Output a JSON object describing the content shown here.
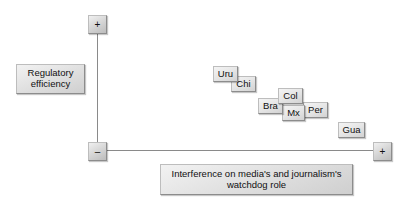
{
  "figure": {
    "type": "scatter",
    "background_color": "#ffffff",
    "box_fill_color": "#e3e3e3",
    "box_border_color": "#8c8c8c",
    "axis_color": "#8a8a8a"
  },
  "axes": {
    "y": {
      "label": "Regulatory efficiency",
      "positive_marker": "+",
      "negative_marker": "–"
    },
    "x": {
      "label": "Interference on media's and journalism's watchdog role",
      "positive_marker": "+",
      "negative_marker": "–"
    }
  },
  "chart_data": {
    "type": "scatter",
    "title": "",
    "xlabel": "Interference on media's and journalism's watchdog role",
    "ylabel": "Regulatory efficiency",
    "xlim": [
      0,
      1
    ],
    "ylim": [
      0,
      1
    ],
    "grid": false,
    "legend": "none",
    "axis_markers": {
      "y_top": "+",
      "y_bottom": "–",
      "x_left": "–",
      "x_right": "+"
    },
    "annotations": [
      "Axes are qualitative: vertical axis runs from – (bottom) to + (top); horizontal axis runs from – (left) to + (right).",
      "Countries are plotted as labelled boxes forming a downward-sloping band from upper-left to lower-right."
    ],
    "points": [
      {
        "label": "Uru",
        "name": "Uruguay",
        "x": 0.44,
        "y": 0.68
      },
      {
        "label": "Chi",
        "name": "Chile",
        "x": 0.51,
        "y": 0.61
      },
      {
        "label": "Bra",
        "name": "Brazil",
        "x": 0.6,
        "y": 0.5
      },
      {
        "label": "Col",
        "name": "Colombia",
        "x": 0.67,
        "y": 0.55
      },
      {
        "label": "Mx",
        "name": "Mexico",
        "x": 0.69,
        "y": 0.44
      },
      {
        "label": "Per",
        "name": "Peru",
        "x": 0.76,
        "y": 0.46
      },
      {
        "label": "Gua",
        "name": "Guatemala",
        "x": 0.89,
        "y": 0.31
      }
    ]
  },
  "points_layout": [
    {
      "label": "Uru",
      "left": 213,
      "top": 66,
      "width": 25,
      "height": 16,
      "z": 7
    },
    {
      "label": "Chi",
      "left": 231,
      "top": 76,
      "width": 25,
      "height": 16,
      "z": 6
    },
    {
      "label": "Bra",
      "left": 258,
      "top": 98,
      "width": 25,
      "height": 16,
      "z": 4
    },
    {
      "label": "Col",
      "left": 278,
      "top": 88,
      "width": 25,
      "height": 16,
      "z": 5
    },
    {
      "label": "Mx",
      "left": 282,
      "top": 105,
      "width": 23,
      "height": 16,
      "z": 3
    },
    {
      "label": "Per",
      "left": 303,
      "top": 102,
      "width": 25,
      "height": 16,
      "z": 2
    },
    {
      "label": "Gua",
      "left": 338,
      "top": 122,
      "width": 27,
      "height": 16,
      "z": 1
    }
  ]
}
